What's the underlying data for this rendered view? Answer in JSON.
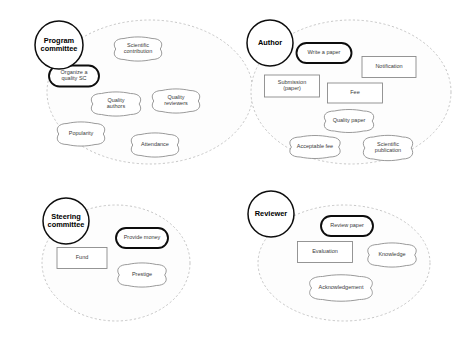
{
  "diagram": {
    "notation": "i-star goal model",
    "colors": {
      "background": "#ffffff",
      "boundary_stroke": "#b9b9b9",
      "actor_stroke": "#0d0d0d",
      "node_stroke": "#8f8f8f",
      "emphasis_stroke": "#0d0d0d",
      "text": "#3a3a3a"
    },
    "actors": [
      {
        "id": "program-committee",
        "label": "Program committee",
        "label_lines": [
          "Program",
          "committee"
        ],
        "boundary": {
          "cx": 150,
          "cy": 92,
          "rx": 103,
          "ry": 72
        },
        "circle": {
          "cx": 59,
          "cy": 45,
          "r": 24
        },
        "nodes": [
          {
            "id": "scientific-contribution",
            "label": "Scientific contribution",
            "label_lines": [
              "Scientific",
              "contribution"
            ],
            "type": "softgoal",
            "emphasis": false,
            "box": {
              "cx": 138,
              "cy": 49,
              "w": 50,
              "h": 21
            }
          },
          {
            "id": "organize-a-quality-sc",
            "label": "Organize a quality SC",
            "label_lines": [
              "Organize a",
              "quality SC"
            ],
            "type": "goal",
            "emphasis": true,
            "box": {
              "cx": 74,
              "cy": 76,
              "w": 50,
              "h": 21
            }
          },
          {
            "id": "quality-authors",
            "label": "Quality authors",
            "label_lines": [
              "Quality",
              "authors"
            ],
            "type": "softgoal",
            "emphasis": false,
            "box": {
              "cx": 116,
              "cy": 104,
              "w": 52,
              "h": 21
            }
          },
          {
            "id": "quality-reviewers",
            "label": "Quality reviewers",
            "label_lines": [
              "Quality",
              "reviewers"
            ],
            "type": "softgoal",
            "emphasis": false,
            "box": {
              "cx": 176,
              "cy": 101,
              "w": 50,
              "h": 21
            }
          },
          {
            "id": "popularity",
            "label": "Popularity",
            "label_lines": [
              "Popularity"
            ],
            "type": "softgoal",
            "emphasis": false,
            "box": {
              "cx": 81,
              "cy": 134,
              "w": 50,
              "h": 21
            }
          },
          {
            "id": "attendance",
            "label": "Attendance",
            "label_lines": [
              "Attendance"
            ],
            "type": "softgoal",
            "emphasis": false,
            "box": {
              "cx": 155,
              "cy": 145,
              "w": 50,
              "h": 21
            }
          }
        ]
      },
      {
        "id": "author",
        "label": "Author",
        "label_lines": [
          "Author"
        ],
        "boundary": {
          "cx": 351,
          "cy": 92,
          "rx": 100,
          "ry": 72
        },
        "circle": {
          "cx": 270,
          "cy": 43,
          "r": 23
        },
        "nodes": [
          {
            "id": "write-a-paper",
            "label": "Write a paper",
            "label_lines": [
              "Write a paper"
            ],
            "type": "goal",
            "emphasis": true,
            "box": {
              "cx": 324,
              "cy": 53,
              "w": 55,
              "h": 20
            }
          },
          {
            "id": "notification",
            "label": "Notification",
            "label_lines": [
              "Notification"
            ],
            "type": "resource",
            "emphasis": false,
            "box": {
              "cx": 389,
              "cy": 67,
              "w": 54,
              "h": 21
            }
          },
          {
            "id": "submission-paper",
            "label": "Submission (paper)",
            "label_lines": [
              "Submission",
              "(paper)"
            ],
            "type": "resource",
            "emphasis": false,
            "box": {
              "cx": 292,
              "cy": 86,
              "w": 55,
              "h": 22
            }
          },
          {
            "id": "fee",
            "label": "Fee",
            "label_lines": [
              "Fee"
            ],
            "type": "resource",
            "emphasis": false,
            "box": {
              "cx": 355,
              "cy": 93,
              "w": 55,
              "h": 20
            }
          },
          {
            "id": "quality-paper",
            "label": "Quality paper",
            "label_lines": [
              "Quality paper"
            ],
            "type": "softgoal",
            "emphasis": false,
            "box": {
              "cx": 349,
              "cy": 121,
              "w": 52,
              "h": 20
            }
          },
          {
            "id": "acceptable-fee",
            "label": "Acceptable fee",
            "label_lines": [
              "Acceptable fee"
            ],
            "type": "softgoal",
            "emphasis": false,
            "box": {
              "cx": 315,
              "cy": 147,
              "w": 53,
              "h": 20
            }
          },
          {
            "id": "scientific-publication",
            "label": "Scientific publication",
            "label_lines": [
              "Scientific",
              "publication"
            ],
            "type": "softgoal",
            "emphasis": false,
            "box": {
              "cx": 388,
              "cy": 148,
              "w": 52,
              "h": 22
            }
          }
        ]
      },
      {
        "id": "steering-committee",
        "label": "Steering committee",
        "label_lines": [
          "Steering",
          "committee"
        ],
        "boundary": {
          "cx": 116,
          "cy": 263,
          "rx": 74,
          "ry": 58
        },
        "circle": {
          "cx": 66,
          "cy": 221,
          "r": 23
        },
        "nodes": [
          {
            "id": "provide-money",
            "label": "Provide money",
            "label_lines": [
              "Provide money"
            ],
            "type": "goal",
            "emphasis": true,
            "box": {
              "cx": 142,
              "cy": 238,
              "w": 52,
              "h": 20
            }
          },
          {
            "id": "fund",
            "label": "Fund",
            "label_lines": [
              "Fund"
            ],
            "type": "resource",
            "emphasis": false,
            "box": {
              "cx": 82,
              "cy": 258,
              "w": 50,
              "h": 21
            }
          },
          {
            "id": "prestige",
            "label": "Prestige",
            "label_lines": [
              "Prestige"
            ],
            "type": "softgoal",
            "emphasis": false,
            "box": {
              "cx": 142,
              "cy": 275,
              "w": 51,
              "h": 21
            }
          }
        ]
      },
      {
        "id": "reviewer",
        "label": "Reviewer",
        "label_lines": [
          "Reviewer"
        ],
        "boundary": {
          "cx": 344,
          "cy": 263,
          "rx": 86,
          "ry": 58
        },
        "circle": {
          "cx": 271,
          "cy": 214,
          "r": 23
        },
        "nodes": [
          {
            "id": "review-paper",
            "label": "Review paper",
            "label_lines": [
              "Review paper"
            ],
            "type": "goal",
            "emphasis": true,
            "box": {
              "cx": 347,
              "cy": 226,
              "w": 52,
              "h": 20
            }
          },
          {
            "id": "evaluation",
            "label": "Evaluation",
            "label_lines": [
              "Evaluation"
            ],
            "type": "resource",
            "emphasis": false,
            "box": {
              "cx": 325,
              "cy": 252,
              "w": 55,
              "h": 21
            }
          },
          {
            "id": "knowledge",
            "label": "Knowledge",
            "label_lines": [
              "Knowledge"
            ],
            "type": "softgoal",
            "emphasis": false,
            "box": {
              "cx": 392,
              "cy": 255,
              "w": 51,
              "h": 21
            }
          },
          {
            "id": "acknowledgement",
            "label": "Acknowledgement",
            "label_lines": [
              "Acknowledgement"
            ],
            "type": "softgoal",
            "emphasis": false,
            "box": {
              "cx": 341,
              "cy": 288,
              "w": 66,
              "h": 23
            }
          }
        ]
      }
    ]
  }
}
